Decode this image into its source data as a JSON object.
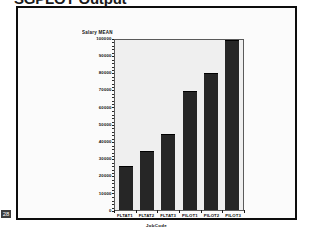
{
  "slide": {
    "title": "SGPLOT Output",
    "page_number": "28"
  },
  "chart_data": {
    "type": "bar",
    "title": "",
    "xlabel": "JobCode",
    "ylabel": "Salary MEAN",
    "categories": [
      "FLTAT1",
      "FLTAT2",
      "FLTAT3",
      "PILOT1",
      "PILOT2",
      "PILOT3"
    ],
    "values": [
      26000,
      35000,
      45000,
      70000,
      80500,
      100000
    ],
    "ylim": [
      0,
      100000
    ],
    "yticks": [
      0,
      10000,
      20000,
      30000,
      40000,
      50000,
      60000,
      70000,
      80000,
      90000,
      100000
    ],
    "ytick_labels": [
      "0",
      "10000",
      "20000",
      "30000",
      "40000",
      "50000",
      "60000",
      "70000",
      "80000",
      "90000",
      "100000"
    ],
    "grid": false,
    "legend": "none",
    "bar_color": "#262626",
    "plot_background": "#efefef",
    "axis_color": "#1a1a1a"
  }
}
